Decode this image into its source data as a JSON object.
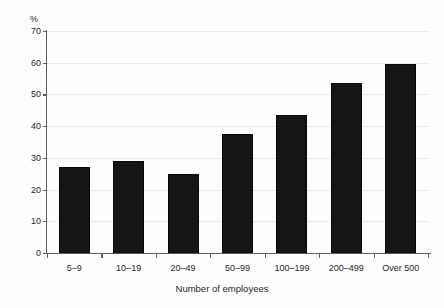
{
  "chart_data": {
    "type": "bar",
    "title": "",
    "subtitle": "",
    "xlabel": "Number of employees",
    "ylabel": "",
    "unit_label": "%",
    "categories": [
      "5–9",
      "10–19",
      "20–49",
      "50–99",
      "100–199",
      "200–499",
      "Over 500"
    ],
    "values": [
      27,
      29,
      25,
      37.5,
      43.5,
      53.5,
      59.5
    ],
    "ylim": [
      0,
      70
    ],
    "ytick_step": 10,
    "yticks": [
      0,
      10,
      20,
      30,
      40,
      50,
      60,
      70
    ],
    "ytick_labels": [
      "0",
      "10",
      "20",
      "30",
      "40",
      "50",
      "60",
      "70"
    ],
    "grid": true,
    "grid_style": "dotted",
    "legend": false,
    "legend_position": "none",
    "bar_color": "#151515",
    "grid_color": "#d7d7d7",
    "axis_color": "#5d5d5d",
    "background": "#fdfdfd",
    "annotations": []
  }
}
